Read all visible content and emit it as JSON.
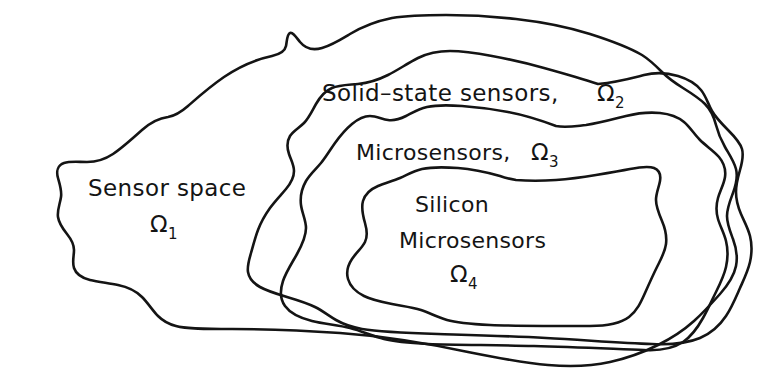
{
  "figure": {
    "type": "nested-set-diagram",
    "background_color": "#ffffff",
    "stroke_color": "#141414"
  },
  "regions": [
    {
      "id": "omega1",
      "level": 1,
      "name_line1": "Sensor space",
      "omega": "Ω",
      "subscript": "1",
      "label_x": 88,
      "label_y": 196,
      "sub_x": 150,
      "sub_y": 232
    },
    {
      "id": "omega2",
      "level": 2,
      "name_line1": "Solid–state sensors,",
      "omega": "Ω",
      "subscript": "2",
      "label_x": 322,
      "label_y": 101,
      "sub_x": 597,
      "sub_y": 101
    },
    {
      "id": "omega3",
      "level": 3,
      "name_line1": "Microsensors,",
      "omega": "Ω",
      "subscript": "3",
      "label_x": 356,
      "label_y": 160,
      "sub_x": 531,
      "sub_y": 160
    },
    {
      "id": "omega4",
      "level": 4,
      "name_line1": "Silicon",
      "name_line2": "Microsensors",
      "omega": "Ω",
      "subscript": "4",
      "label_x": 415,
      "label_y": 212,
      "label2_x": 399,
      "label2_y": 248,
      "sub_x": 450,
      "sub_y": 282
    }
  ],
  "paths": {
    "omega1": "M 392 18 C 372 22 360 28 350 34 C 340 40 332 45 322 48 C 312 51 305 48 300 42 C 296 37 293 32 290 33 C 287 34 287 41 286 46 C 285 51 281 54 272 56 C 258 59 240 66 224 77 C 208 88 196 99 188 106 C 180 113 174 116 168 117 C 160 118 151 122 142 130 C 132 139 122 148 113 154 C 104 160 95 162 87 162 C 78 162 70 161 64 163 C 58 165 56 171 58 178 C 60 185 62 191 61 197 C 60 204 57 210 58 217 C 59 224 63 229 67 234 C 71 239 74 244 74 250 C 74 256 72 262 74 268 C 76 274 82 278 90 280 C 98 282 108 283 118 285 C 128 287 136 291 142 297 C 148 303 153 311 158 316 C 163 321 168 324 176 326 C 186 329 206 329 232 329 C 260 329 298 330 340 333 C 382 336 426 343 468 352 C 498 358 524 363 548 365 C 572 367 592 366 610 362 C 628 358 644 352 658 345 C 672 338 684 330 694 321 C 704 312 712 303 720 294 C 728 285 734 276 736 266 C 738 256 736 247 733 239 C 730 231 727 224 727 216 C 727 208 730 201 733 193 C 736 185 738 177 736 169 C 734 161 729 154 725 147 C 721 140 718 133 716 125 C 714 117 711 110 705 104 C 699 98 691 93 683 88 C 675 83 668 78 662 72 C 656 66 650 60 642 55 C 630 48 612 41 590 34 C 568 27 542 22 516 19 C 490 16 466 15 446 15 C 426 15 410 15 392 18 Z",
    "omega2": "M 598 84 C 580 78 562 73 544 68 C 526 63 508 59 492 56 C 476 53 462 51 450 51 C 438 51 428 53 418 58 C 408 63 398 70 388 75 C 378 80 368 83 358 84 C 348 85 339 85 332 88 C 325 91 320 97 316 104 C 312 111 309 118 304 123 C 299 128 293 131 290 136 C 287 141 287 148 289 154 C 291 160 294 165 294 171 C 294 177 291 183 286 189 C 281 195 275 201 270 208 C 265 215 261 222 258 230 C 255 238 253 246 251 253 C 249 260 247 266 248 272 C 249 278 253 283 260 287 C 267 291 277 294 287 297 C 297 300 307 303 315 307 C 323 311 329 316 336 320 C 343 324 351 327 362 329 C 380 332 406 333 438 334 C 470 335 508 336 546 338 C 584 340 622 343 652 344 C 672 345 688 343 700 338 C 712 333 720 325 726 316 C 732 307 736 297 740 288 C 744 279 748 271 750 262 C 752 253 752 244 750 236 C 748 228 744 221 741 214 C 738 207 736 200 736 192 C 736 184 738 177 740 170 C 742 163 744 156 742 149 C 740 142 734 136 728 130 C 722 124 716 118 712 111 C 708 104 706 96 701 90 C 696 84 688 79 678 76 C 668 73 656 72 644 75 C 632 78 618 82 598 84 Z",
    "omega3": "M 556 126 C 540 120 524 115 508 112 C 492 109 476 107 462 106 C 448 105 436 105 427 107 C 418 109 412 113 406 116 C 400 119 394 121 388 120 C 382 119 376 116 370 116 C 364 116 358 119 352 124 C 346 129 340 136 335 143 C 330 150 326 157 321 163 C 316 169 310 174 306 181 C 302 188 300 197 301 205 C 302 213 306 220 306 228 C 306 236 302 245 297 254 C 292 263 286 272 283 281 C 280 290 280 299 285 306 C 290 313 300 318 312 321 C 324 324 338 325 350 328 C 362 331 372 336 384 339 C 396 342 410 343 428 344 C 456 345 494 345 534 346 C 574 347 616 349 644 350 C 662 351 674 348 683 342 C 692 336 698 327 703 318 C 708 309 712 300 716 292 C 720 284 724 276 726 267 C 728 258 728 249 726 241 C 724 233 720 226 718 219 C 716 212 716 205 718 198 C 720 191 724 184 725 177 C 726 170 724 163 719 157 C 714 151 706 146 700 140 C 694 134 690 127 684 122 C 678 117 670 114 660 113 C 650 112 638 113 626 116 C 614 119 600 123 586 125 C 576 126 566 128 556 126 Z",
    "omega4": "M 500 176 C 486 172 472 169 458 168 C 444 167 431 167 422 169 C 413 171 407 175 400 178 C 393 181 385 183 378 186 C 371 189 365 194 363 201 C 361 208 363 216 365 223 C 367 230 368 236 365 242 C 362 248 356 253 352 259 C 348 265 346 272 348 279 C 350 286 356 292 364 296 C 372 300 382 302 392 304 C 402 306 412 307 421 310 C 430 313 437 317 447 320 C 457 323 470 324 490 325 C 518 326 558 326 590 326 C 608 326 621 323 629 317 C 637 311 641 302 645 293 C 649 284 653 275 657 267 C 661 259 665 252 666 244 C 667 236 665 228 662 221 C 659 214 656 207 656 200 C 656 193 659 187 660 181 C 661 175 659 170 654 168 C 649 166 640 167 630 169 C 620 171 608 173 596 175 C 584 177 570 179 556 180 C 542 181 528 181 516 180 C 510 179 505 178 500 176 Z"
  }
}
